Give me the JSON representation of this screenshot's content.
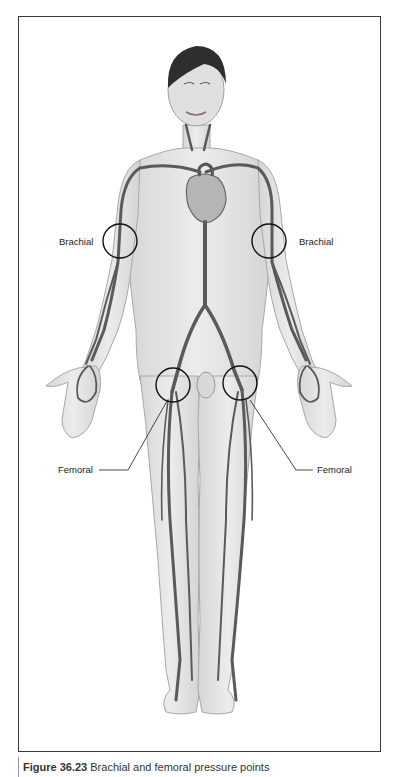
{
  "figure": {
    "style": "grayscale illustration",
    "colors": {
      "frame": "#3a3a3a",
      "skin": "#e2e2e2",
      "skin_outline": "#a8a8a8",
      "artery": "#5a5a5a",
      "hair": "#2e2e2e",
      "marker_circle": "#111111",
      "label_text": "#222222"
    }
  },
  "labels": {
    "brachial_left": "Brachial",
    "brachial_right": "Brachial",
    "femoral_left": "Femoral",
    "femoral_right": "Femoral"
  },
  "markers": [
    {
      "name": "brachial-left",
      "cx": 120,
      "cy": 241,
      "r": 17
    },
    {
      "name": "brachial-right",
      "cx": 269,
      "cy": 241,
      "r": 17
    },
    {
      "name": "femoral-left",
      "cx": 173,
      "cy": 385,
      "r": 17
    },
    {
      "name": "femoral-right",
      "cx": 240,
      "cy": 383,
      "r": 17
    }
  ],
  "caption": {
    "number": "Figure 36.23",
    "text": " Brachial and femoral pressure points"
  }
}
